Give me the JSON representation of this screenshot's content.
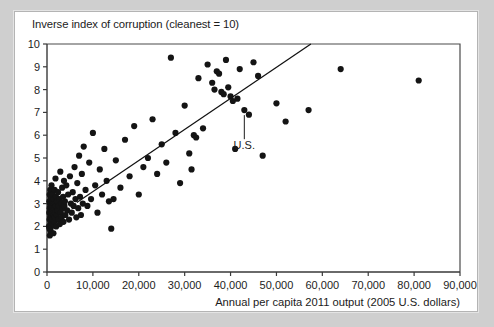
{
  "figure": {
    "title": "Inverse index of corruption (cleanest = 10)",
    "x_axis_title": "Annual per capita 2011 output (2005 U.S. dollars)",
    "annotation_label": "U.S."
  },
  "chart_data": {
    "type": "scatter",
    "title": "Inverse index of corruption (cleanest = 10)",
    "subtitle": "",
    "xlabel": "Annual per capita 2011 output (2005 U.S. dollars)",
    "ylabel": "Inverse index of corruption (cleanest = 10)",
    "xlim": [
      0,
      90000
    ],
    "ylim": [
      0,
      10
    ],
    "xticks": [
      0,
      10000,
      20000,
      30000,
      40000,
      50000,
      60000,
      70000,
      80000,
      90000
    ],
    "xticklabels": [
      "0",
      "10,000",
      "20,000",
      "30,000",
      "40,000",
      "50,000",
      "60,000",
      "70,000",
      "80,000",
      "90,000"
    ],
    "yticks": [
      0,
      1,
      2,
      3,
      4,
      5,
      6,
      7,
      8,
      9,
      10
    ],
    "yticklabels": [
      "0",
      "1",
      "2",
      "3",
      "4",
      "5",
      "6",
      "7",
      "8",
      "9",
      "10"
    ],
    "grid": false,
    "legend": "none",
    "marker_color": "#141414",
    "marker_size": 3.1,
    "trendline": {
      "label": "fitted regression line",
      "color": "#111111",
      "x_start": 6500,
      "y_start": 3.05,
      "x_end": 57500,
      "y_end": 10.0
    },
    "annotations": [
      {
        "label": "U.S.",
        "x": 43000,
        "y": 7.1,
        "label_x": 43000,
        "label_y": 6.0
      }
    ],
    "series": [
      {
        "name": "Countries",
        "points": [
          [
            450,
            2.0
          ],
          [
            500,
            2.6
          ],
          [
            520,
            3.1
          ],
          [
            540,
            1.9
          ],
          [
            560,
            2.3
          ],
          [
            580,
            3.4
          ],
          [
            600,
            2.8
          ],
          [
            620,
            1.6
          ],
          [
            650,
            3.0
          ],
          [
            680,
            2.4
          ],
          [
            700,
            3.6
          ],
          [
            720,
            2.1
          ],
          [
            740,
            2.9
          ],
          [
            760,
            3.3
          ],
          [
            780,
            1.8
          ],
          [
            800,
            2.5
          ],
          [
            820,
            3.2
          ],
          [
            850,
            2.2
          ],
          [
            880,
            2.7
          ],
          [
            900,
            3.5
          ],
          [
            950,
            2.0
          ],
          [
            980,
            3.8
          ],
          [
            1000,
            2.6
          ],
          [
            1050,
            3.1
          ],
          [
            1100,
            2.3
          ],
          [
            1150,
            2.9
          ],
          [
            1200,
            3.4
          ],
          [
            1250,
            2.1
          ],
          [
            1300,
            2.7
          ],
          [
            1350,
            3.0
          ],
          [
            1400,
            1.7
          ],
          [
            1450,
            2.5
          ],
          [
            1500,
            3.2
          ],
          [
            1550,
            2.8
          ],
          [
            1600,
            2.2
          ],
          [
            1650,
            3.6
          ],
          [
            1700,
            2.4
          ],
          [
            1750,
            3.0
          ],
          [
            1800,
            2.6
          ],
          [
            1850,
            4.1
          ],
          [
            1900,
            2.9
          ],
          [
            1950,
            3.3
          ],
          [
            2000,
            2.0
          ],
          [
            2100,
            2.5
          ],
          [
            2200,
            3.1
          ],
          [
            2300,
            2.7
          ],
          [
            2400,
            3.5
          ],
          [
            2500,
            2.3
          ],
          [
            2600,
            2.9
          ],
          [
            2700,
            3.2
          ],
          [
            2800,
            2.1
          ],
          [
            2900,
            4.4
          ],
          [
            3000,
            2.6
          ],
          [
            3100,
            3.0
          ],
          [
            3200,
            2.4
          ],
          [
            3300,
            3.7
          ],
          [
            3400,
            2.8
          ],
          [
            3500,
            3.3
          ],
          [
            3600,
            2.2
          ],
          [
            3700,
            4.0
          ],
          [
            3800,
            2.9
          ],
          [
            3900,
            3.1
          ],
          [
            4000,
            2.5
          ],
          [
            4200,
            3.8
          ],
          [
            4400,
            2.7
          ],
          [
            4600,
            3.4
          ],
          [
            4800,
            2.3
          ],
          [
            5000,
            4.2
          ],
          [
            5200,
            3.0
          ],
          [
            5400,
            2.6
          ],
          [
            5600,
            3.5
          ],
          [
            5800,
            2.9
          ],
          [
            6000,
            4.6
          ],
          [
            6200,
            3.2
          ],
          [
            6400,
            2.4
          ],
          [
            6600,
            3.9
          ],
          [
            6800,
            2.8
          ],
          [
            7000,
            5.1
          ],
          [
            7200,
            3.3
          ],
          [
            7400,
            2.5
          ],
          [
            7600,
            4.3
          ],
          [
            7800,
            3.0
          ],
          [
            8000,
            5.5
          ],
          [
            8400,
            3.6
          ],
          [
            8800,
            2.9
          ],
          [
            9200,
            4.8
          ],
          [
            9600,
            3.2
          ],
          [
            10000,
            6.1
          ],
          [
            10500,
            3.8
          ],
          [
            11000,
            2.6
          ],
          [
            11500,
            4.5
          ],
          [
            12000,
            3.4
          ],
          [
            12500,
            5.4
          ],
          [
            13000,
            4.0
          ],
          [
            13500,
            3.1
          ],
          [
            14000,
            1.9
          ],
          [
            14500,
            3.2
          ],
          [
            15000,
            4.9
          ],
          [
            16000,
            3.7
          ],
          [
            17000,
            5.8
          ],
          [
            18000,
            4.2
          ],
          [
            19000,
            6.4
          ],
          [
            20000,
            3.4
          ],
          [
            21000,
            4.6
          ],
          [
            22000,
            5.0
          ],
          [
            23000,
            6.7
          ],
          [
            24000,
            4.3
          ],
          [
            25000,
            5.6
          ],
          [
            26000,
            4.8
          ],
          [
            27000,
            9.4
          ],
          [
            28000,
            6.1
          ],
          [
            29000,
            3.9
          ],
          [
            30000,
            7.3
          ],
          [
            31000,
            5.2
          ],
          [
            31500,
            4.5
          ],
          [
            32000,
            6.0
          ],
          [
            32500,
            5.9
          ],
          [
            33000,
            8.5
          ],
          [
            34000,
            6.3
          ],
          [
            35000,
            9.1
          ],
          [
            36000,
            8.3
          ],
          [
            36500,
            8.0
          ],
          [
            37000,
            8.8
          ],
          [
            37500,
            8.7
          ],
          [
            38000,
            7.9
          ],
          [
            38500,
            7.8
          ],
          [
            39000,
            9.3
          ],
          [
            39500,
            8.1
          ],
          [
            40000,
            7.7
          ],
          [
            40500,
            7.5
          ],
          [
            41000,
            5.4
          ],
          [
            41500,
            7.6
          ],
          [
            42000,
            8.9
          ],
          [
            43000,
            7.1
          ],
          [
            44000,
            6.9
          ],
          [
            45000,
            9.2
          ],
          [
            46000,
            8.6
          ],
          [
            47000,
            5.1
          ],
          [
            50000,
            7.4
          ],
          [
            52000,
            6.6
          ],
          [
            57000,
            7.1
          ],
          [
            64000,
            8.9
          ],
          [
            81000,
            8.4
          ]
        ]
      }
    ]
  }
}
